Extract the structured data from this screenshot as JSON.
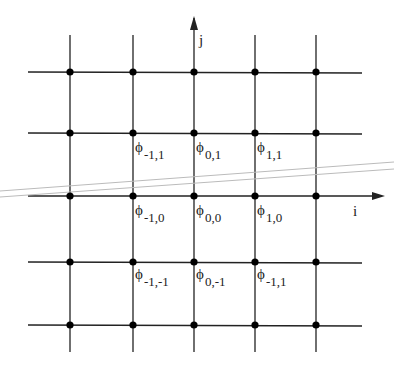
{
  "diagram": {
    "axes": {
      "x_label": "i",
      "y_label": "j"
    },
    "grid": {
      "x": [
        70,
        133,
        194,
        255,
        316
      ],
      "y": [
        72,
        133,
        196,
        262,
        325
      ]
    },
    "labels": [
      {
        "base": "ϕ",
        "sub": "-1,1",
        "x": 135,
        "y": 152
      },
      {
        "base": "ϕ",
        "sub": "0,1",
        "x": 196,
        "y": 152
      },
      {
        "base": "ϕ",
        "sub": "1,1",
        "x": 257,
        "y": 152
      },
      {
        "base": "ϕ",
        "sub": "-1,0",
        "x": 135,
        "y": 215
      },
      {
        "base": "ϕ",
        "sub": "0,0",
        "x": 196,
        "y": 215
      },
      {
        "base": "ϕ",
        "sub": "1,0",
        "x": 257,
        "y": 215
      },
      {
        "base": "ϕ",
        "sub": "-1,-1",
        "x": 135,
        "y": 279
      },
      {
        "base": "ϕ",
        "sub": "0,-1",
        "x": 196,
        "y": 279
      },
      {
        "base": "ϕ",
        "sub": "-1,1",
        "x": 257,
        "y": 279
      }
    ],
    "colors": {
      "line": "#222222",
      "overlay": "#bbbbbb"
    }
  }
}
